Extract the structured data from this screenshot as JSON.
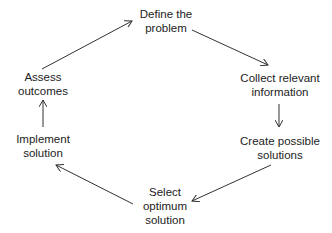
{
  "diagram": {
    "type": "cycle",
    "nodes": [
      {
        "id": "define",
        "line1": "Define the",
        "line2": "problem"
      },
      {
        "id": "collect",
        "line1": "Collect relevant",
        "line2": "information"
      },
      {
        "id": "create",
        "line1": "Create possible",
        "line2": "solutions"
      },
      {
        "id": "select",
        "line1": "Select",
        "line2": "optimum",
        "line3": "solution"
      },
      {
        "id": "implement",
        "line1": "Implement",
        "line2": "solution"
      },
      {
        "id": "assess",
        "line1": "Assess",
        "line2": "outcomes"
      }
    ],
    "edges": [
      {
        "from": "define",
        "to": "collect"
      },
      {
        "from": "collect",
        "to": "create"
      },
      {
        "from": "create",
        "to": "select"
      },
      {
        "from": "select",
        "to": "implement"
      },
      {
        "from": "implement",
        "to": "assess"
      },
      {
        "from": "assess",
        "to": "define"
      }
    ],
    "colors": {
      "stroke": "#333333",
      "text": "#222222"
    }
  }
}
